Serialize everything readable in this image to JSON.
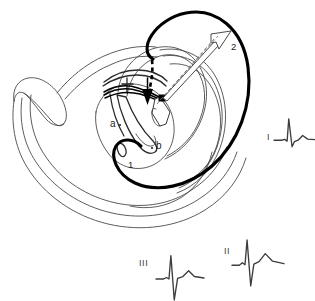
{
  "figure": {
    "kind": "anatomical-line-diagram",
    "background_color": "#ffffff",
    "line_color": "#2a2a2a",
    "thin_line_color": "#4a4a4a",
    "bold_circuit_color": "#000000",
    "trace_color": "#3d3d3d"
  },
  "annotations": {
    "circuit_1": "1",
    "circuit_2": "2",
    "site_a": "a",
    "site_b": "b"
  },
  "ecg": {
    "leads": [
      {
        "id": "lead-I",
        "label": "I",
        "label_x": 267,
        "label_y": 133,
        "trace_x": 274,
        "trace_y": 108,
        "width": 41,
        "height": 52,
        "description": "tall-R-small-S-low-T",
        "waveform": [
          {
            "t": 0.0,
            "mv": 0.0
          },
          {
            "t": 0.18,
            "mv": 0.0
          },
          {
            "t": 0.26,
            "mv": 0.04
          },
          {
            "t": 0.32,
            "mv": -0.04
          },
          {
            "t": 0.36,
            "mv": 0.98
          },
          {
            "t": 0.44,
            "mv": -0.3
          },
          {
            "t": 0.5,
            "mv": -0.06
          },
          {
            "t": 0.6,
            "mv": 0.02
          },
          {
            "t": 0.7,
            "mv": 0.22
          },
          {
            "t": 0.82,
            "mv": 0.05
          },
          {
            "t": 1.0,
            "mv": 0.03
          }
        ]
      },
      {
        "id": "lead-II",
        "label": "II",
        "label_x": 224,
        "label_y": 247,
        "trace_x": 232,
        "trace_y": 228,
        "width": 52,
        "height": 60,
        "description": "tall-R-deep-S-broad-T",
        "waveform": [
          {
            "t": 0.0,
            "mv": 0.0
          },
          {
            "t": 0.14,
            "mv": 0.0
          },
          {
            "t": 0.2,
            "mv": 0.1
          },
          {
            "t": 0.25,
            "mv": 0.02
          },
          {
            "t": 0.29,
            "mv": 1.0
          },
          {
            "t": 0.36,
            "mv": -0.82
          },
          {
            "t": 0.42,
            "mv": 0.04
          },
          {
            "t": 0.52,
            "mv": 0.14
          },
          {
            "t": 0.64,
            "mv": 0.46
          },
          {
            "t": 0.78,
            "mv": 0.16
          },
          {
            "t": 1.0,
            "mv": 0.06
          }
        ]
      },
      {
        "id": "lead-III",
        "label": "III",
        "label_x": 139,
        "label_y": 259,
        "trace_x": 156,
        "trace_y": 243,
        "width": 48,
        "height": 58,
        "description": "tall-R-deep-S-small-T",
        "waveform": [
          {
            "t": 0.0,
            "mv": 0.0
          },
          {
            "t": 0.16,
            "mv": 0.0
          },
          {
            "t": 0.22,
            "mv": 0.06
          },
          {
            "t": 0.27,
            "mv": 0.0
          },
          {
            "t": 0.31,
            "mv": 0.96
          },
          {
            "t": 0.38,
            "mv": -0.86
          },
          {
            "t": 0.45,
            "mv": 0.02
          },
          {
            "t": 0.56,
            "mv": 0.1
          },
          {
            "t": 0.68,
            "mv": 0.34
          },
          {
            "t": 0.8,
            "mv": 0.1
          },
          {
            "t": 1.0,
            "mv": 0.04
          }
        ]
      }
    ]
  },
  "markers": {
    "ablation_square": {
      "x": 162,
      "y": 98,
      "size": 6
    },
    "site_a_dot": {
      "x": 119,
      "y": 124
    },
    "site_b_dot": {
      "x": 152,
      "y": 146
    }
  }
}
